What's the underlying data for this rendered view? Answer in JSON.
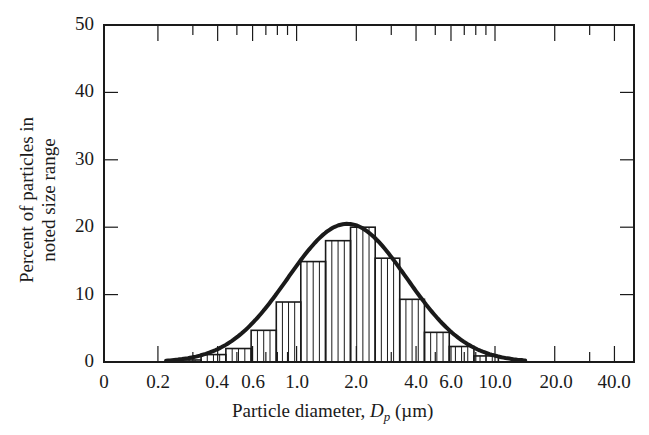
{
  "chart_data": {
    "type": "bar",
    "subtype": "histogram-with-fitted-curve",
    "title": "",
    "xlabel": "Particle diameter, D_p (µm)",
    "xlabel_parts": {
      "text": "Particle diameter, ",
      "symbol": "D",
      "subscript": "p",
      "unit": " (µm)"
    },
    "ylabel": "Percent of particles in noted size range",
    "ylabel_lines": [
      "Percent of particles in",
      "noted size range"
    ],
    "xscale": "log",
    "xlim": [
      0.1,
      60
    ],
    "ylim": [
      0,
      50
    ],
    "grid": false,
    "legend": null,
    "x_tick_labels": [
      "0",
      "0.2",
      "0.4",
      "0.6",
      "1.0",
      "2.0",
      "4.0",
      "6.0",
      "10.0",
      "20.0",
      "40.0"
    ],
    "y_tick_labels": [
      "0",
      "10",
      "20",
      "30",
      "40",
      "50"
    ],
    "bin_edges_um": [
      0.25,
      0.33,
      0.44,
      0.59,
      0.79,
      1.05,
      1.4,
      1.87,
      2.49,
      3.31,
      4.41,
      5.88,
      7.83,
      10.4
    ],
    "values": [
      0.3,
      1.1,
      2.0,
      4.7,
      8.9,
      14.9,
      18.0,
      20.0,
      15.4,
      9.3,
      4.4,
      2.3,
      0.9
    ],
    "curve": {
      "name": "log-normal fit",
      "peak_x_um": 1.8,
      "peak_y": 20.5,
      "start_x_um": 0.22,
      "end_x_um": 14.5
    },
    "colors": {
      "ink": "#1a1a1a",
      "background": "#ffffff"
    }
  }
}
